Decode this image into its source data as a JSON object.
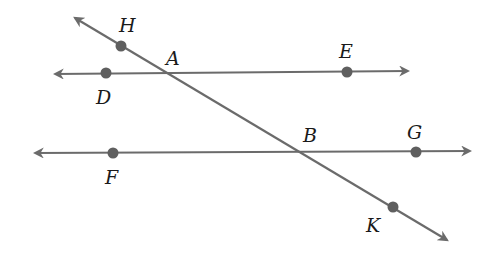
{
  "diagram": {
    "colors": {
      "line": "#6b6b6b",
      "point": "#5f5f5f",
      "label": "#1a1a1a",
      "background": "#ffffff"
    },
    "lines": [
      {
        "id": "line-DE",
        "x1": 55,
        "y1": 74,
        "x2": 408,
        "y2": 71,
        "arrows": "both"
      },
      {
        "id": "line-FG",
        "x1": 35,
        "y1": 153,
        "x2": 470,
        "y2": 151,
        "arrows": "both"
      },
      {
        "id": "transversal-HK",
        "x1": 75,
        "y1": 18,
        "x2": 447,
        "y2": 240,
        "arrows": "both"
      }
    ],
    "points": [
      {
        "name": "H",
        "x": 121,
        "y": 46,
        "label": "H",
        "lx": 119,
        "ly": 32
      },
      {
        "name": "D",
        "x": 106,
        "y": 73,
        "label": "D",
        "lx": 96,
        "ly": 104
      },
      {
        "name": "E",
        "x": 347,
        "y": 72,
        "label": "E",
        "lx": 339,
        "ly": 58
      },
      {
        "name": "F",
        "x": 113,
        "y": 153,
        "label": "F",
        "lx": 105,
        "ly": 184
      },
      {
        "name": "G",
        "x": 416,
        "y": 152,
        "label": "G",
        "lx": 407,
        "ly": 139
      },
      {
        "name": "K",
        "x": 393,
        "y": 207,
        "label": "K",
        "lx": 366,
        "ly": 232
      }
    ],
    "intersections": [
      {
        "name": "A",
        "label": "A",
        "lx": 166,
        "ly": 65
      },
      {
        "name": "B",
        "label": "B",
        "lx": 303,
        "ly": 142
      }
    ],
    "labels": {
      "H": "H",
      "A": "A",
      "E": "E",
      "D": "D",
      "B": "B",
      "G": "G",
      "F": "F",
      "K": "K"
    }
  }
}
